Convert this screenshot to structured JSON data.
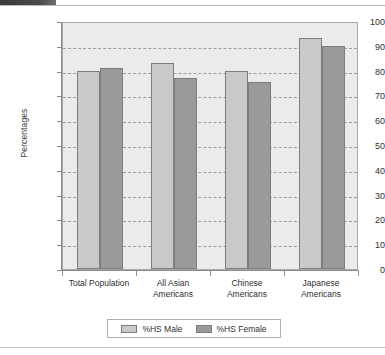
{
  "decoration": {
    "top_tab_color": "#4a4a4a",
    "rule_color": "#c2c2c2"
  },
  "chart_data": {
    "type": "bar",
    "title": "",
    "xlabel": "",
    "ylabel": "Percentages",
    "ylim": [
      0,
      100
    ],
    "ytick_step": 10,
    "yticks": [
      "100",
      "90",
      "80",
      "70",
      "60",
      "50",
      "40",
      "30",
      "20",
      "10",
      "0"
    ],
    "grid": true,
    "grid_style": "dashed-horizontal",
    "legend_position": "bottom-center",
    "plot_background": "#ebebeb",
    "categories": [
      "Total Population",
      "All Asian\nAmericans",
      "Chinese\nAmericans",
      "Japanese\nAmericans"
    ],
    "series": [
      {
        "name": "%HS Male",
        "color": "#c9c9c9",
        "values": [
          80,
          83,
          80,
          93
        ]
      },
      {
        "name": "%HS Female",
        "color": "#9a9a9a",
        "values": [
          81,
          77,
          75.5,
          90
        ]
      }
    ]
  }
}
